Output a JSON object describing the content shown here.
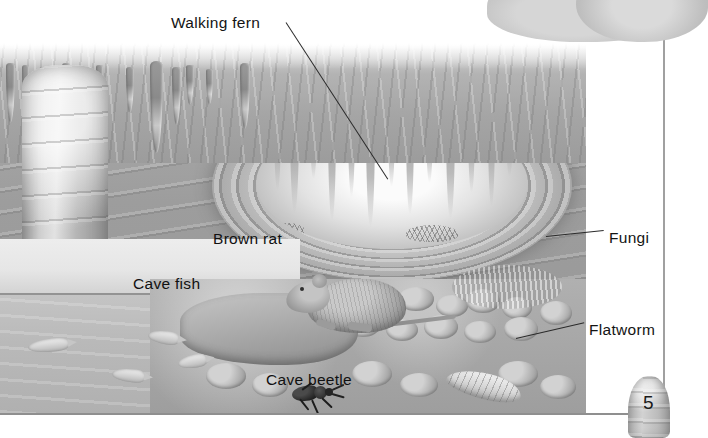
{
  "page": {
    "number": "5",
    "background_color": "#ffffff",
    "illustration_title": "Cave ecosystem cross-section",
    "style": "grayscale pencil illustration"
  },
  "labels": [
    {
      "id": "walking-fern",
      "text": "Walking fern",
      "x": 171,
      "y": 14,
      "has_leader": true
    },
    {
      "id": "brown-rat",
      "text": "Brown rat",
      "x": 213,
      "y": 230,
      "has_leader": false
    },
    {
      "id": "cave-fish",
      "text": "Cave fish",
      "x": 133,
      "y": 275,
      "has_leader": false
    },
    {
      "id": "cave-beetle",
      "text": "Cave beetle",
      "x": 266,
      "y": 371,
      "has_leader": false
    },
    {
      "id": "fungi",
      "text": "Fungi",
      "x": 609,
      "y": 229,
      "has_leader": true
    },
    {
      "id": "flatworm",
      "text": "Flatworm",
      "x": 589,
      "y": 321,
      "has_leader": true
    }
  ],
  "scene": {
    "features": [
      "stalactites",
      "flowstone column",
      "rock strata wall",
      "tunnel opening",
      "underground pool",
      "cobble floor",
      "fungi patch",
      "fern clumps"
    ],
    "organisms": [
      {
        "name": "Brown rat",
        "count": 1
      },
      {
        "name": "Cave fish",
        "count": 4
      },
      {
        "name": "Cave beetle",
        "count": 1
      },
      {
        "name": "Flatworm",
        "count": 1
      },
      {
        "name": "Walking fern",
        "count": 2
      },
      {
        "name": "Fungi",
        "count": 1
      }
    ]
  },
  "decor": {
    "corner_rock_top_right": "rock-mass",
    "corner_stalagmite_bottom_right": "stalagmite",
    "vertical_rule": true,
    "horizontal_rule": true
  },
  "colors": {
    "ink": "#141414",
    "rule": "#8f8f8f",
    "rock_light": "#d2d2d2",
    "rock_mid": "#a6a6a6",
    "rock_dark": "#8b8b8b",
    "water": "#b9b9b9"
  }
}
